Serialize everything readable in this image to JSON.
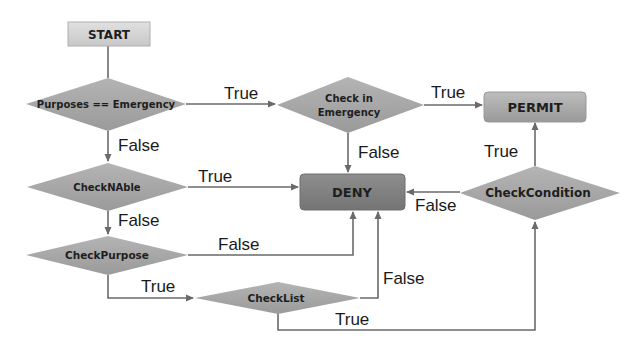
{
  "diagram": {
    "type": "flowchart",
    "nodes": {
      "start": {
        "label": "START",
        "shape": "rectangle"
      },
      "purposes_emergency": {
        "label": "Purposes == Emergency",
        "shape": "diamond"
      },
      "check_in_emergency": {
        "label_line1": "Check in",
        "label_line2": "Emergency",
        "shape": "diamond"
      },
      "permit": {
        "label": "PERMIT",
        "shape": "rounded-rectangle"
      },
      "check_n_able": {
        "label": "CheckNAble",
        "shape": "diamond"
      },
      "deny": {
        "label": "DENY",
        "shape": "rounded-rectangle"
      },
      "check_condition": {
        "label": "CheckCondition",
        "shape": "diamond"
      },
      "check_purpose": {
        "label": "CheckPurpose",
        "shape": "diamond"
      },
      "check_list": {
        "label": "CheckList",
        "shape": "diamond"
      }
    },
    "edges": [
      {
        "from": "start",
        "to": "purposes_emergency",
        "label": ""
      },
      {
        "from": "purposes_emergency",
        "to": "check_in_emergency",
        "label": "True"
      },
      {
        "from": "purposes_emergency",
        "to": "check_n_able",
        "label": "False"
      },
      {
        "from": "check_in_emergency",
        "to": "permit",
        "label": "True"
      },
      {
        "from": "check_in_emergency",
        "to": "deny",
        "label": "False"
      },
      {
        "from": "check_n_able",
        "to": "deny",
        "label": "True"
      },
      {
        "from": "check_n_able",
        "to": "check_purpose",
        "label": "False"
      },
      {
        "from": "check_purpose",
        "to": "deny",
        "label": "False"
      },
      {
        "from": "check_purpose",
        "to": "check_list",
        "label": "True"
      },
      {
        "from": "check_list",
        "to": "deny",
        "label": "False"
      },
      {
        "from": "check_list",
        "to": "check_condition",
        "label": "True"
      },
      {
        "from": "check_condition",
        "to": "permit",
        "label": "True"
      },
      {
        "from": "check_condition",
        "to": "deny",
        "label": "False"
      }
    ],
    "colors": {
      "start_fill": "#d4d4d4",
      "diamond_fill": "#a6a6a6",
      "permit_fill": "#a9a9a9",
      "deny_fill": "#808080",
      "line": "#6a6a6a"
    }
  }
}
